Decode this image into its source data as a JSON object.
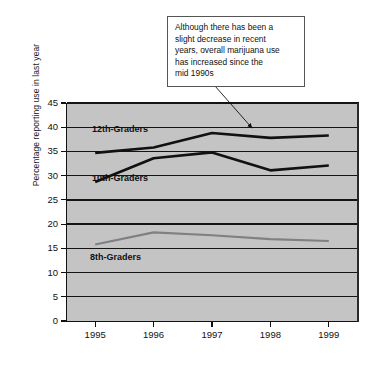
{
  "chart_data": {
    "type": "line",
    "title": "",
    "xlabel": "",
    "ylabel": "Percentage reporting use in last year",
    "categories": [
      "1995",
      "1996",
      "1997",
      "1998",
      "1999"
    ],
    "x": [
      1995,
      1996,
      1997,
      1998,
      1999
    ],
    "ylim": [
      0,
      45
    ],
    "yticks": [
      0,
      5,
      10,
      15,
      20,
      25,
      30,
      35,
      40,
      45
    ],
    "grid": true,
    "legend_position": "inline-labels",
    "series": [
      {
        "name": "12th-Graders",
        "color": "#111111",
        "values": [
          34.7,
          35.8,
          38.8,
          37.8,
          38.3
        ]
      },
      {
        "name": "10th-Graders",
        "color": "#111111",
        "values": [
          28.7,
          33.6,
          34.8,
          31.1,
          32.1
        ]
      },
      {
        "name": "8th-Graders",
        "color": "#808080",
        "values": [
          15.8,
          18.3,
          17.7,
          16.9,
          16.5
        ]
      }
    ],
    "annotations": [
      {
        "id": "trend-callout",
        "text": "Although there has been a slight decrease in recent years, overall marijuana use has increased since the mid 1990s",
        "lines": [
          "Although there has been a",
          "slight decrease in recent",
          "years, overall marijuana use",
          "has increased since the",
          "mid 1990s"
        ],
        "points_to_series": "12th-Graders",
        "points_to_x": 1998
      }
    ]
  },
  "plot": {
    "background_color": "#c4c4c4",
    "axis_color": "#111111",
    "gridline_color": "#141414"
  },
  "series_labels": {
    "twelfth": "12th-Graders",
    "tenth": "10th-Graders",
    "eighth": "8th-Graders"
  },
  "axes": {
    "y_title": "Percentage reporting use in last year",
    "y_ticks": [
      "45",
      "40",
      "35",
      "30",
      "25",
      "20",
      "15",
      "10",
      "5",
      "0"
    ],
    "x_ticks": [
      "1995",
      "1996",
      "1997",
      "1998",
      "1999"
    ]
  },
  "callout": {
    "line1": "Although there has been a",
    "line2": "slight decrease in recent",
    "line3": "years, overall marijuana use",
    "line4": "has increased since the",
    "line5": "mid 1990s"
  }
}
